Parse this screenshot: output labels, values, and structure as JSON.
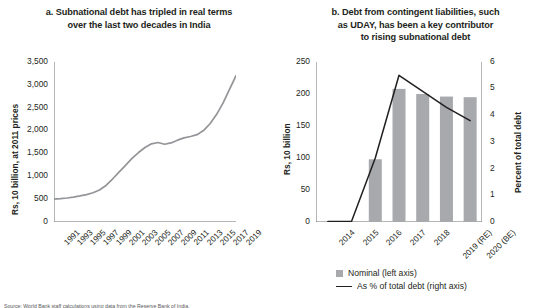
{
  "source_note": "Source: World Bank staff calculations using data from the Reserve Bank of India.",
  "legend": {
    "items": [
      {
        "label": "Nominal (left axis)",
        "marker": "square",
        "color": "#a7a9ac"
      },
      {
        "label": "As % of total debt (right axis)",
        "marker": "line",
        "color": "#231f20"
      }
    ]
  },
  "chart_data": [
    {
      "panel": "a",
      "type": "line",
      "title": "a. Subnational debt has tripled in real terms over the last two decades in India",
      "title_lines": [
        "a. Subnational debt has tripled in real terms",
        "over the last two decades in India"
      ],
      "xlabel": "",
      "ylabel": "Rs, 10 billion, at 2011 prices",
      "ylim": [
        0,
        3500
      ],
      "yticks": [
        0,
        500,
        1000,
        1500,
        2000,
        2500,
        3000,
        3500
      ],
      "ytick_labels": [
        "0",
        "500",
        "1,000",
        "1,500",
        "2,000",
        "2,500",
        "3,000",
        "3,500"
      ],
      "xlim": [
        1991,
        2019
      ],
      "xticks": [
        1991,
        1993,
        1995,
        1997,
        1999,
        2001,
        2003,
        2005,
        2007,
        2009,
        2011,
        2013,
        2015,
        2017,
        2019
      ],
      "xtick_labels": [
        "1991",
        "1993",
        "1995",
        "1997",
        "1999",
        "2001",
        "2003",
        "2005",
        "2007",
        "2009",
        "2011",
        "2013",
        "2015",
        "2017",
        "2019"
      ],
      "grid": false,
      "line_color": "#939598",
      "series": [
        {
          "name": "Subnational debt (real)",
          "x": [
            1991,
            1992,
            1993,
            1994,
            1995,
            1996,
            1997,
            1998,
            1999,
            2000,
            2001,
            2002,
            2003,
            2004,
            2005,
            2006,
            2007,
            2008,
            2009,
            2010,
            2011,
            2012,
            2013,
            2014,
            2015,
            2016,
            2017,
            2018,
            2019
          ],
          "values": [
            500,
            510,
            525,
            545,
            570,
            600,
            640,
            700,
            800,
            940,
            1090,
            1240,
            1390,
            1520,
            1630,
            1710,
            1740,
            1700,
            1730,
            1790,
            1840,
            1870,
            1910,
            2000,
            2150,
            2350,
            2600,
            2900,
            3200
          ]
        }
      ]
    },
    {
      "panel": "b",
      "type": "bar",
      "title": "b. Debt from contingent liabilities, such as UDAY, has been a key contributor to rising subnational debt",
      "title_lines": [
        "b. Debt from contingent liabilities, such",
        "as UDAY, has been a key contributor",
        "to rising subnational debt"
      ],
      "xlabel": "",
      "ylabel": "Rs, 10 billion",
      "ylabel_right": "Percent of total debt",
      "ylim": [
        0,
        250
      ],
      "yticks": [
        0,
        50,
        100,
        150,
        200,
        250
      ],
      "ytick_labels": [
        "0",
        "50",
        "100",
        "150",
        "200",
        "250"
      ],
      "ylim_right": [
        0,
        6
      ],
      "yticks_right": [
        0,
        1,
        2,
        3,
        4,
        5,
        6
      ],
      "ytick_labels_right": [
        "0",
        "1",
        "2",
        "3",
        "4",
        "5",
        "6"
      ],
      "categories": [
        "2014",
        "2015",
        "2016",
        "2017",
        "2018",
        "2019 (RE)",
        "2020 (BE)"
      ],
      "grid": false,
      "bar_color": "#a7a9ac",
      "line_color": "#231f20",
      "series": [
        {
          "name": "Nominal (left axis)",
          "axis": "left",
          "type": "bar",
          "values": [
            0,
            1,
            98,
            208,
            200,
            196,
            195
          ]
        },
        {
          "name": "As % of total debt (right axis)",
          "axis": "right",
          "type": "line",
          "values": [
            0.02,
            0.03,
            2.4,
            5.5,
            4.9,
            4.3,
            3.8
          ]
        }
      ]
    }
  ]
}
